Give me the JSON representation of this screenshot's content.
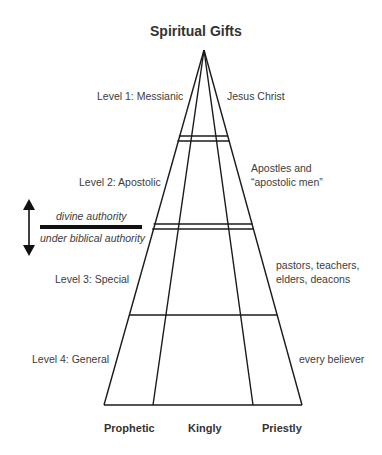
{
  "title": "Spiritual Gifts",
  "levels": [
    {
      "label": "Level 1: Messianic",
      "description": "Jesus Christ"
    },
    {
      "label": "Level 2: Apostolic",
      "description_lines": [
        "Apostles and",
        "“apostolic men”"
      ]
    },
    {
      "label": "Level 3: Special",
      "description_lines": [
        "pastors, teachers,",
        "elders, deacons"
      ]
    },
    {
      "label": "Level 4: General",
      "description": "every believer"
    }
  ],
  "authority": {
    "above": "divine authority",
    "below": "under biblical authority",
    "arrow_icon": "double-headed-vertical-arrow"
  },
  "columns": [
    "Prophetic",
    "Kingly",
    "Priestly"
  ],
  "colors": {
    "lines": "#1a1a1a",
    "text": "#3c3c3c"
  }
}
